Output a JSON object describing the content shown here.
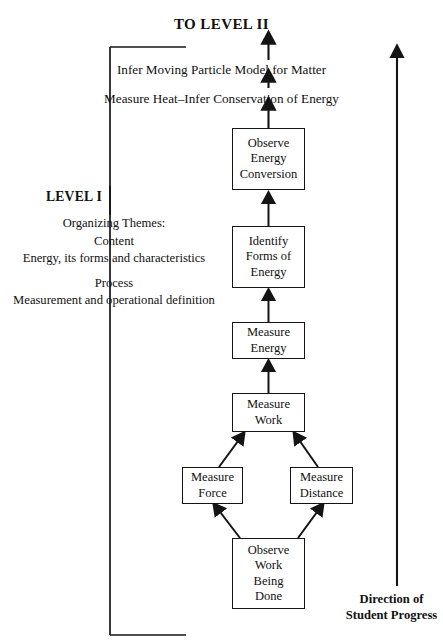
{
  "figure": {
    "top_title": "TO LEVEL II",
    "statements": [
      "Infer Moving Particle Model for Matter",
      "Measure Heat–Infer Conservation of Energy"
    ],
    "level_label": "LEVEL I",
    "themes": {
      "heading": "Organizing Themes:",
      "content_label": "Content",
      "content_text": "Energy, its forms and characteristics",
      "process_label": "Process",
      "process_text": "Measurement and operational definition"
    },
    "direction": {
      "line1": "Direction of",
      "line2": "Student Progress"
    },
    "nodes": [
      {
        "id": "observe-energy-conversion",
        "label": "Observe\nEnergy\nConversion"
      },
      {
        "id": "identify-forms-of-energy",
        "label": "Identify\nForms of\nEnergy"
      },
      {
        "id": "measure-energy",
        "label": "Measure\nEnergy"
      },
      {
        "id": "measure-work",
        "label": "Measure\nWork"
      },
      {
        "id": "measure-force",
        "label": "Measure\nForce"
      },
      {
        "id": "measure-distance",
        "label": "Measure\nDistance"
      },
      {
        "id": "observe-work-being-done",
        "label": "Observe\nWork\nBeing\nDone"
      }
    ],
    "colors": {
      "stroke": "#141414",
      "background": "#ffffff",
      "text": "#111111"
    }
  }
}
